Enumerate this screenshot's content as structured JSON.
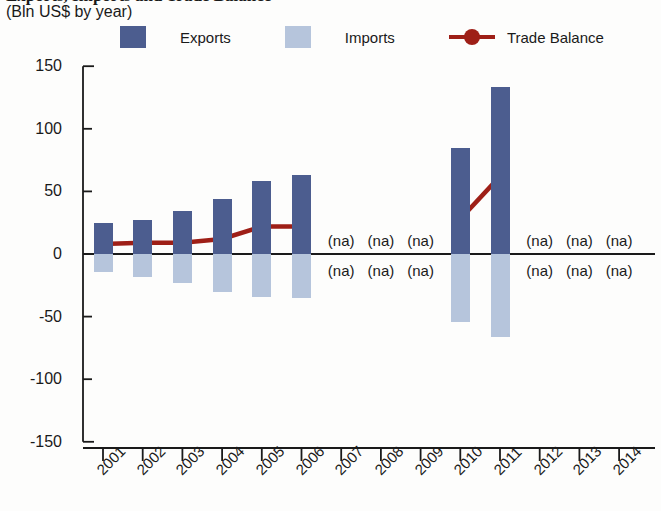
{
  "header": {
    "title": "Exports, Imports and Trade Balance",
    "subtitle": "(Bln US$ by year)"
  },
  "legend": {
    "items": [
      {
        "label": "Exports",
        "type": "swatch",
        "color": "#4c5d8f"
      },
      {
        "label": "Imports",
        "type": "swatch",
        "color": "#b6c5dc"
      },
      {
        "label": "Trade Balance",
        "type": "line",
        "color": "#9e1f17"
      }
    ]
  },
  "chart_data": {
    "type": "bar",
    "title": "Exports, Imports and Trade Balance",
    "subtitle": "(Bln US$ by year)",
    "xlabel": "",
    "ylabel": "",
    "ylim": [
      -150,
      150
    ],
    "yticks": [
      150,
      100,
      50,
      0,
      -50,
      -100,
      -150
    ],
    "ytick_labels": [
      "150",
      "100",
      "50",
      "0",
      "-50",
      "-100",
      "-150"
    ],
    "grid": false,
    "legend_position": "top",
    "categories": [
      "2001",
      "2002",
      "2003",
      "2004",
      "2005",
      "2006",
      "2007",
      "2008",
      "2009",
      "2010",
      "2011",
      "2012",
      "2013",
      "2014"
    ],
    "series": [
      {
        "name": "Exports",
        "color": "#4c5d8f",
        "type": "bar",
        "values": [
          25,
          27,
          34,
          44,
          58,
          63,
          null,
          null,
          null,
          85,
          133,
          null,
          null,
          null
        ]
      },
      {
        "name": "Imports",
        "color": "#b6c5dc",
        "type": "bar",
        "values": [
          -14,
          -18,
          -23,
          -30,
          -34,
          -35,
          null,
          null,
          null,
          -54,
          -66,
          null,
          null,
          null
        ]
      },
      {
        "name": "Trade Balance",
        "color": "#9e1f17",
        "type": "line",
        "values": [
          8,
          9,
          9,
          12,
          22,
          22,
          null,
          null,
          null,
          28,
          62,
          null,
          null,
          null
        ]
      }
    ],
    "missing_label": "(na)",
    "missing_years": [
      "2007",
      "2008",
      "2009",
      "2012",
      "2013",
      "2014"
    ],
    "annotations": [
      {
        "year": "2007",
        "position": "above-axis",
        "text": "(na)"
      },
      {
        "year": "2008",
        "position": "above-axis",
        "text": "(na)"
      },
      {
        "year": "2009",
        "position": "above-axis",
        "text": "(na)"
      },
      {
        "year": "2012",
        "position": "above-axis",
        "text": "(na)"
      },
      {
        "year": "2013",
        "position": "above-axis",
        "text": "(na)"
      },
      {
        "year": "2014",
        "position": "above-axis",
        "text": "(na)"
      },
      {
        "year": "2007",
        "position": "below-axis",
        "text": "(na)"
      },
      {
        "year": "2008",
        "position": "below-axis",
        "text": "(na)"
      },
      {
        "year": "2009",
        "position": "below-axis",
        "text": "(na)"
      },
      {
        "year": "2012",
        "position": "below-axis",
        "text": "(na)"
      },
      {
        "year": "2013",
        "position": "below-axis",
        "text": "(na)"
      },
      {
        "year": "2014",
        "position": "below-axis",
        "text": "(na)"
      }
    ]
  }
}
